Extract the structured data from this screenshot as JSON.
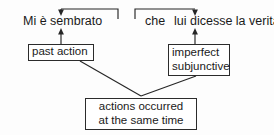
{
  "diagram": {
    "title_fragment": "",
    "sentence": {
      "clause_main": "Mi è sembrato",
      "conjunction": "che",
      "clause_subordinate": "lui dicesse la verità."
    },
    "boxes": {
      "past_action": "past action",
      "imperfect_line1": "imperfect",
      "imperfect_line2": "subjunctive",
      "same_time_line1": "actions occurred",
      "same_time_line2": "at the same time"
    },
    "colors": {
      "ink": "#262626",
      "paper": "#fdfdfd"
    }
  }
}
